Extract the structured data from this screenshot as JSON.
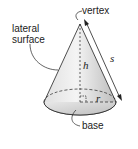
{
  "diagram": {
    "labels": {
      "vertex": "vertex",
      "lateral_surface_line1": "lateral",
      "lateral_surface_line2": "surface",
      "height": "h",
      "slant_height": "s",
      "radius": "r",
      "base": "base"
    },
    "colors": {
      "cone_fill_light": "#f2f2f2",
      "cone_fill_dark": "#bdbdbd",
      "stroke": "#222222",
      "text": "#222222"
    }
  }
}
